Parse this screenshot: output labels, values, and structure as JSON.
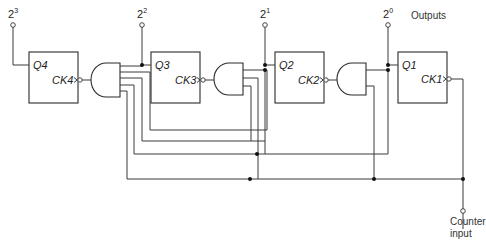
{
  "diagram": {
    "outputs_label": "Outputs",
    "input_label_line1": "Counter",
    "input_label_line2": "input",
    "output_terminals": [
      {
        "base": "2",
        "exp": "3"
      },
      {
        "base": "2",
        "exp": "2"
      },
      {
        "base": "2",
        "exp": "1"
      },
      {
        "base": "2",
        "exp": "0"
      }
    ],
    "flipflops": [
      {
        "q": "Q4",
        "ck": "CK4"
      },
      {
        "q": "Q3",
        "ck": "CK3"
      },
      {
        "q": "Q2",
        "ck": "CK2"
      },
      {
        "q": "Q1",
        "ck": "CK1"
      }
    ],
    "gates": [
      "AND",
      "AND",
      "AND"
    ]
  }
}
